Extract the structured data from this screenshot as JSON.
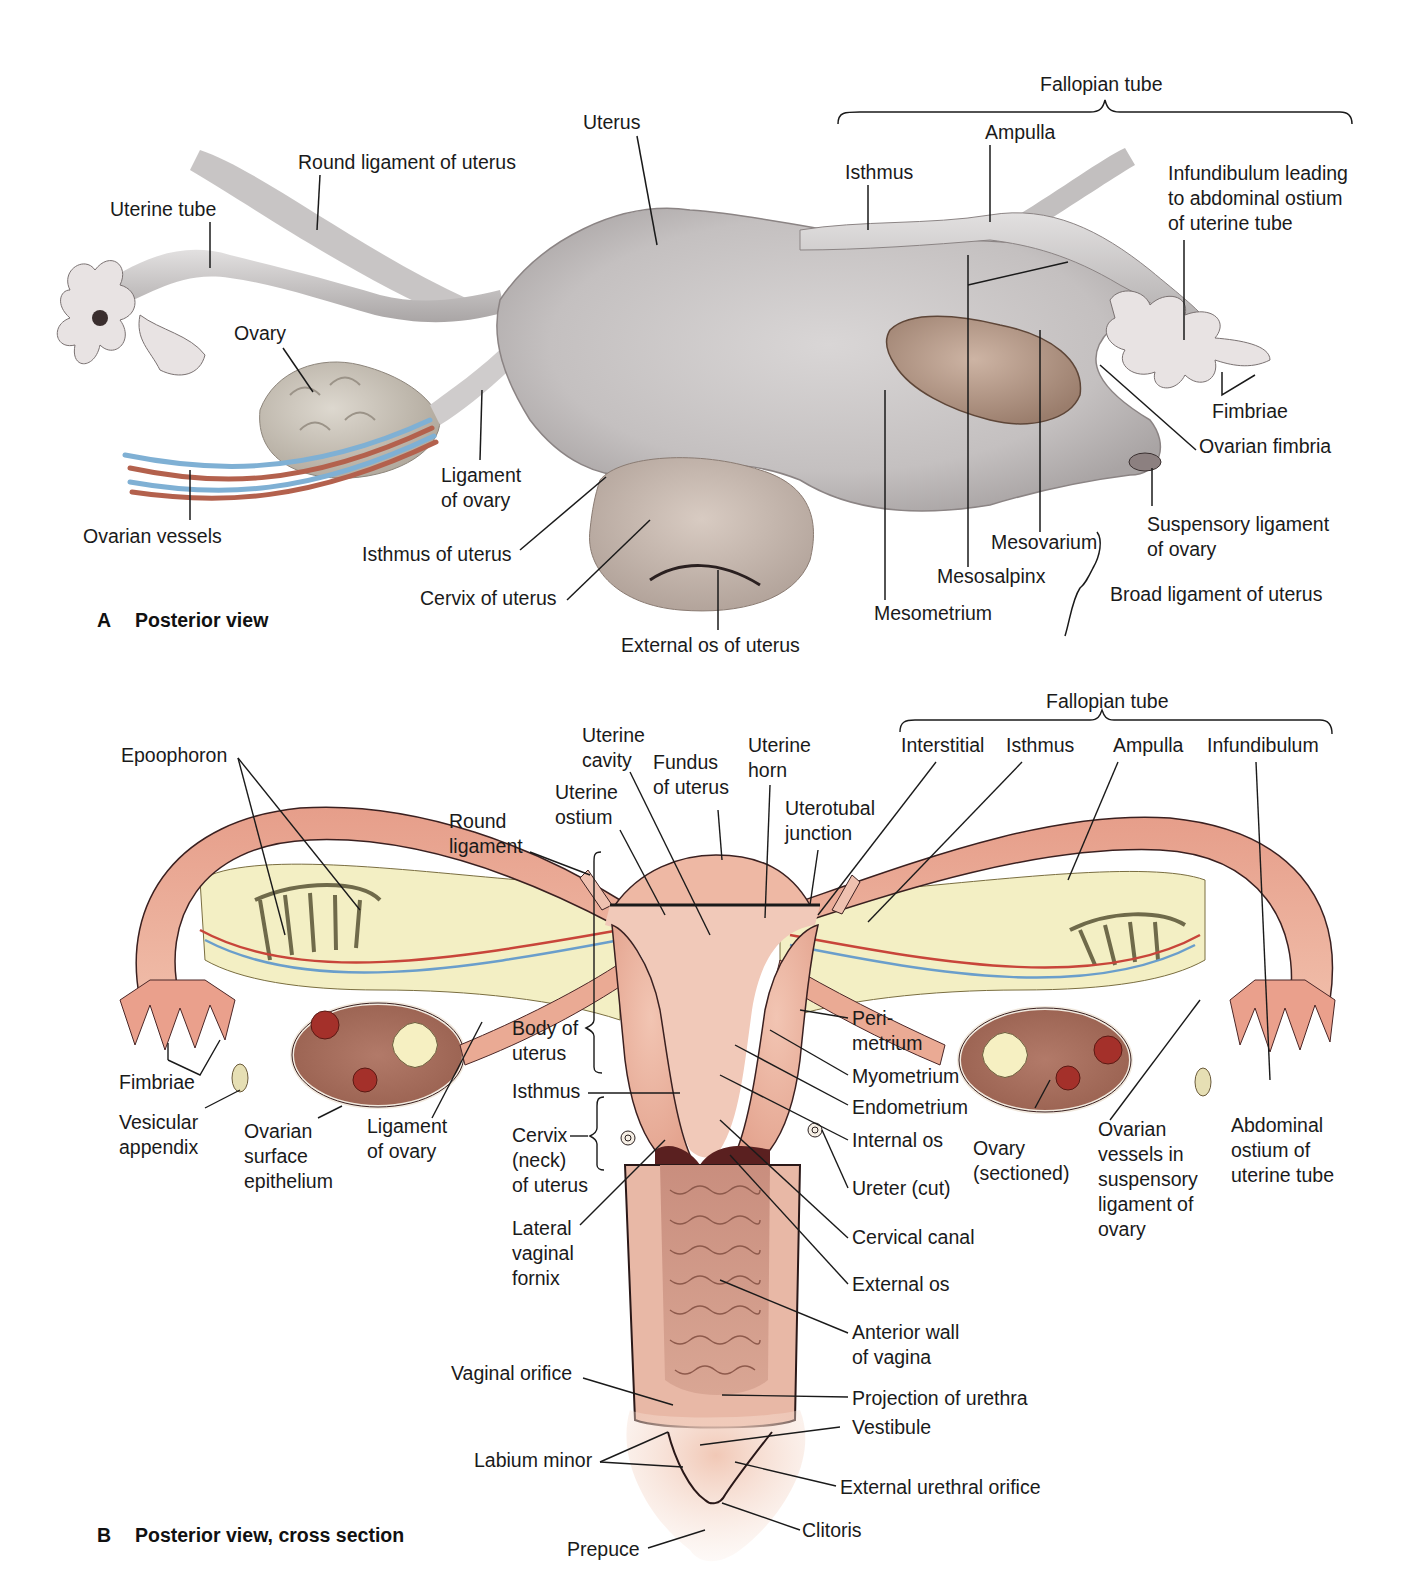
{
  "figure": {
    "panel_a": {
      "letter": "A",
      "title": "Posterior view",
      "group_fallopian": "Fallopian tube",
      "group_broad": "Broad ligament of uterus",
      "labels": {
        "uterus": "Uterus",
        "round_ligament": "Round ligament of uterus",
        "uterine_tube": "Uterine tube",
        "ovary": "Ovary",
        "ovarian_vessels": "Ovarian vessels",
        "ligament_of_ovary": "Ligament\nof ovary",
        "isthmus_of_uterus": "Isthmus of uterus",
        "cervix_of_uterus": "Cervix of uterus",
        "external_os_of_uterus": "External os of uterus",
        "isthmus": "Isthmus",
        "ampulla": "Ampulla",
        "infundibulum": "Infundibulum leading\nto abdominal ostium\nof uterine tube",
        "fimbriae": "Fimbriae",
        "ovarian_fimbria": "Ovarian fimbria",
        "suspensory_ligament": "Suspensory ligament\nof ovary",
        "mesovarium": "Mesovarium",
        "mesosalpinx": "Mesosalpinx",
        "mesometrium": "Mesometrium"
      }
    },
    "panel_b": {
      "letter": "B",
      "title": "Posterior view, cross section",
      "group_fallopian": "Fallopian tube",
      "labels": {
        "epoophoron": "Epoophoron",
        "uterine_cavity": "Uterine\ncavity",
        "fundus": "Fundus\nof uterus",
        "uterine_horn": "Uterine\nhorn",
        "uterine_ostium": "Uterine\nostium",
        "round_ligament": "Round\nligament",
        "uterotubal_junction": "Uterotubal\njunction",
        "interstitial": "Interstitial",
        "isthmus_tube": "Isthmus",
        "ampulla": "Ampulla",
        "infundibulum": "Infundibulum",
        "body_of_uterus": "Body of\nuterus",
        "isthmus": "Isthmus",
        "cervix": "Cervix\n(neck)\nof uterus",
        "lateral_vaginal_fornix": "Lateral\nvaginal\nfornix",
        "fimbriae": "Fimbriae",
        "vesicular_appendix": "Vesicular\nappendix",
        "ovarian_surface_epithelium": "Ovarian\nsurface\nepithelium",
        "ligament_of_ovary": "Ligament\nof ovary",
        "perimetrium": "Peri-\nmetrium",
        "myometrium": "Myometrium",
        "endometrium": "Endometrium",
        "internal_os": "Internal os",
        "ureter": "Ureter (cut)",
        "cervical_canal": "Cervical canal",
        "external_os": "External os",
        "ovary_sectioned": "Ovary\n(sectioned)",
        "ovarian_vessels": "Ovarian\nvessels in\nsuspensory\nligament of\novary",
        "abdominal_ostium": "Abdominal\nostium of\nuterine tube",
        "anterior_wall": "Anterior wall\nof vagina",
        "vaginal_orifice": "Vaginal orifice",
        "projection_urethra": "Projection of urethra",
        "vestibule": "Vestibule",
        "labium_minor": "Labium minor",
        "external_urethral_orifice": "External urethral orifice",
        "clitoris": "Clitoris",
        "prepuce": "Prepuce"
      }
    },
    "colors": {
      "tissue_gray": "#c9c6c6",
      "tissue_pink": "#eab09c",
      "tissue_pink_dark": "#d98f7c",
      "mesentery_yellow": "#f3efc4",
      "ovary_brown": "#a86a5a",
      "artery_red": "#c8453a",
      "vein_blue": "#6a9ecb",
      "line": "#1a1a1a"
    }
  }
}
